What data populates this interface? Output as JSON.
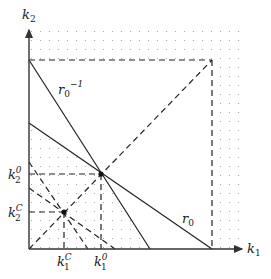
{
  "diagram": {
    "axes": {
      "x_label": {
        "main": "k",
        "sub": "1"
      },
      "y_label": {
        "main": "k",
        "sub": "2"
      }
    },
    "curves": [
      {
        "id": "r0-inverse",
        "label": {
          "main": "r",
          "sub": "0",
          "sup": "−1"
        }
      },
      {
        "id": "r0",
        "label": {
          "main": "r",
          "sub": "0"
        }
      }
    ],
    "points": [
      {
        "id": "k0",
        "x_tick": {
          "main": "k",
          "sub": "1",
          "sup": "0"
        },
        "y_tick": {
          "main": "k",
          "sub": "2",
          "sup": "0"
        }
      },
      {
        "id": "kC",
        "x_tick": {
          "main": "k",
          "sub": "1",
          "sup": "C"
        },
        "y_tick": {
          "main": "k",
          "sub": "2",
          "sup": "C"
        }
      }
    ],
    "colors": {
      "line": "#222222",
      "dots": "#9a9a9a",
      "background": "#ffffff"
    }
  }
}
